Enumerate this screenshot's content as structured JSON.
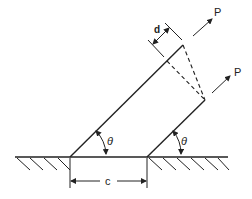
{
  "diagram": {
    "type": "mechanics-schematic",
    "labels": {
      "force_top": "P",
      "force_right": "P",
      "offset": "d",
      "angle_left": "θ",
      "angle_right": "θ",
      "base_width": "c"
    },
    "colors": {
      "stroke": "#222222",
      "background": "#ffffff"
    }
  }
}
